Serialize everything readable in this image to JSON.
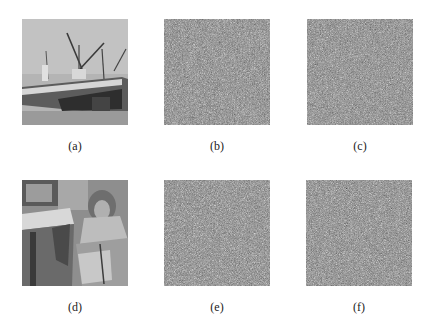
{
  "figure": {
    "rows": [
      {
        "panels": [
          {
            "id": "a",
            "caption": "(a)",
            "content": "Grayscale photo of boats/ships with cranes (Boat image)",
            "kind": "photo"
          },
          {
            "id": "b",
            "caption": "(b)",
            "content": "Noise-like encrypted image",
            "kind": "noise"
          },
          {
            "id": "c",
            "caption": "(c)",
            "content": "Noise-like encrypted image",
            "kind": "noise"
          }
        ]
      },
      {
        "panels": [
          {
            "id": "d",
            "caption": "(d)",
            "content": "Grayscale photo of woman with headscarf sitting (Barbara image)",
            "kind": "photo"
          },
          {
            "id": "e",
            "caption": "(e)",
            "content": "Noise-like encrypted image",
            "kind": "noise"
          },
          {
            "id": "f",
            "caption": "(f)",
            "content": "Noise-like encrypted image",
            "kind": "noise"
          }
        ]
      }
    ],
    "colors": {
      "background": "#ffffff",
      "noise_base": "#7b7b7b",
      "caption_text": "#222222"
    }
  }
}
